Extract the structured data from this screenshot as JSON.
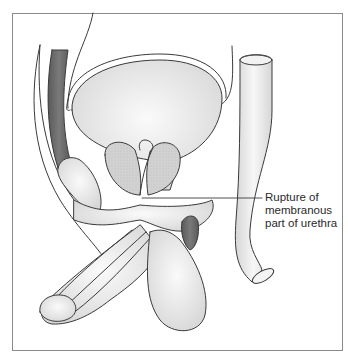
{
  "figure": {
    "type": "anatomical-illustration",
    "annotation": {
      "lines": [
        "Rupture of",
        "membranous",
        "part of urethra"
      ],
      "points_to": "membranous-urethra"
    }
  },
  "colors": {
    "outline": "#3a3a3a",
    "fill_light": "#ececec",
    "fill_mid": "#dcdcdc",
    "prostate": "#cfcfcf",
    "muscle_dark": "#6b6b6b",
    "frame": "#8a8a8a"
  }
}
